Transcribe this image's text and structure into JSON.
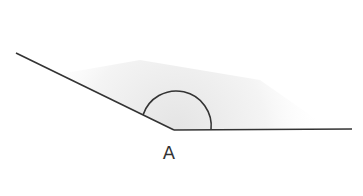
{
  "diagram": {
    "type": "angle",
    "angle_kind": "obtuse",
    "vertex": {
      "label": "A",
      "x": 174,
      "y": 130
    },
    "rays": [
      {
        "name": "left-ray",
        "from": [
          174,
          130
        ],
        "to": [
          16,
          53
        ]
      },
      {
        "name": "right-ray",
        "from": [
          174,
          130
        ],
        "to": [
          352,
          129
        ]
      }
    ],
    "arc": {
      "center": [
        176,
        130
      ],
      "radius": 35
    },
    "colors": {
      "line": "#333333",
      "shading": "#eeeeee",
      "background": "#ffffff"
    }
  }
}
